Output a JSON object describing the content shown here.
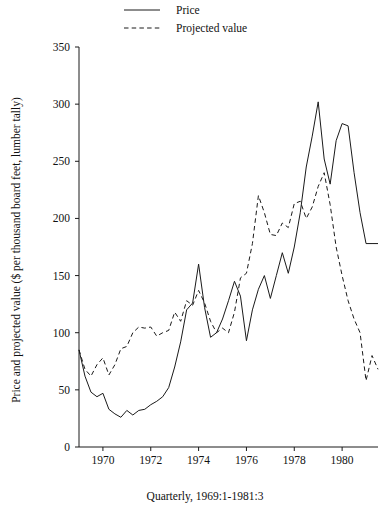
{
  "chart_data": {
    "type": "line",
    "title": "",
    "xlabel": "Quarterly, 1969:1-1981:3",
    "ylabel": "Price and projected value ($ per thousand board feet, lumber tally)",
    "ylim": [
      0,
      350
    ],
    "xlim": [
      1969.0,
      1981.5
    ],
    "yticks": [
      0,
      50,
      100,
      150,
      200,
      250,
      300,
      350
    ],
    "ytick_labels": [
      "0",
      "50",
      "100",
      "150",
      "200",
      "250",
      "300",
      "350"
    ],
    "xticks": [
      1970,
      1972,
      1974,
      1976,
      1978,
      1980
    ],
    "xtick_labels": [
      "1970",
      "1972",
      "1974",
      "1976",
      "1978",
      "1980"
    ],
    "grid": false,
    "legend_position": "top-left",
    "legend": [
      "Price",
      "Projected value"
    ],
    "x": [
      "1969:1",
      "1969:2",
      "1969:3",
      "1969:4",
      "1970:1",
      "1970:2",
      "1970:3",
      "1970:4",
      "1971:1",
      "1971:2",
      "1971:3",
      "1971:4",
      "1972:1",
      "1972:2",
      "1972:3",
      "1972:4",
      "1973:1",
      "1973:2",
      "1973:3",
      "1973:4",
      "1974:1",
      "1974:2",
      "1974:3",
      "1974:4",
      "1975:1",
      "1975:2",
      "1975:3",
      "1975:4",
      "1976:1",
      "1976:2",
      "1976:3",
      "1976:4",
      "1977:1",
      "1977:2",
      "1977:3",
      "1977:4",
      "1978:1",
      "1978:2",
      "1978:3",
      "1978:4",
      "1979:1",
      "1979:2",
      "1979:3",
      "1979:4",
      "1980:1",
      "1980:2",
      "1980:3",
      "1980:4",
      "1981:1",
      "1981:2",
      "1981:3"
    ],
    "x_numeric": [
      1969.0,
      1969.25,
      1969.5,
      1969.75,
      1970.0,
      1970.25,
      1970.5,
      1970.75,
      1971.0,
      1971.25,
      1971.5,
      1971.75,
      1972.0,
      1972.25,
      1972.5,
      1972.75,
      1973.0,
      1973.25,
      1973.5,
      1973.75,
      1974.0,
      1974.25,
      1974.5,
      1974.75,
      1975.0,
      1975.25,
      1975.5,
      1975.75,
      1976.0,
      1976.25,
      1976.5,
      1976.75,
      1977.0,
      1977.25,
      1977.5,
      1977.75,
      1978.0,
      1978.25,
      1978.5,
      1978.75,
      1979.0,
      1979.25,
      1979.5,
      1979.75,
      1980.0,
      1980.25,
      1980.5,
      1980.75,
      1981.0,
      1981.25,
      1981.5
    ],
    "series": [
      {
        "name": "Price",
        "style": "solid",
        "values": [
          85,
          62,
          48,
          44,
          47,
          33,
          29,
          26,
          32,
          28,
          32,
          33,
          37,
          40,
          44,
          52,
          70,
          92,
          120,
          126,
          160,
          122,
          96,
          100,
          112,
          128,
          145,
          132,
          93,
          120,
          138,
          150,
          130,
          150,
          170,
          152,
          175,
          205,
          245,
          272,
          302,
          252,
          230,
          268,
          283,
          281,
          240,
          205,
          178,
          178,
          178
        ]
      },
      {
        "name": "Projected value",
        "style": "dashed",
        "values": [
          85,
          68,
          62,
          72,
          78,
          63,
          72,
          86,
          88,
          100,
          105,
          104,
          105,
          97,
          100,
          102,
          118,
          110,
          128,
          124,
          137,
          126,
          110,
          100,
          104,
          100,
          118,
          148,
          152,
          178,
          220,
          205,
          186,
          185,
          196,
          192,
          213,
          215,
          200,
          210,
          228,
          240,
          212,
          175,
          150,
          128,
          112,
          100,
          58,
          80,
          68
        ]
      }
    ]
  },
  "legend": {
    "items": [
      {
        "label": "Price",
        "style": "solid"
      },
      {
        "label": "Projected value",
        "style": "dashed"
      }
    ]
  },
  "caption": {
    "text": "Quarterly, 1969:1-1981:3"
  },
  "ylabel": {
    "text": "Price and projected value ($ per thousand board feet, lumber tally)"
  },
  "colors": {
    "ink": "#1a1a1a",
    "background": "#ffffff"
  }
}
